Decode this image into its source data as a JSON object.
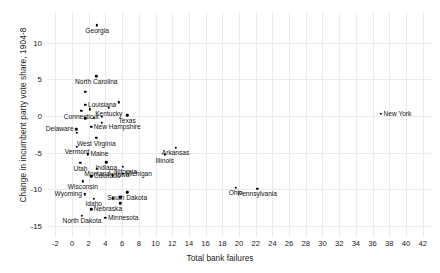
{
  "chart_data": {
    "type": "scatter",
    "title": "",
    "xlabel": "Total bank failures",
    "ylabel": "Change in incumbent party vote share, 1904-8",
    "xlim": [
      -3,
      43
    ],
    "ylim": [
      -16.5,
      14.2
    ],
    "xticks": [
      -2,
      0,
      2,
      4,
      6,
      8,
      10,
      12,
      14,
      16,
      18,
      20,
      22,
      24,
      26,
      28,
      30,
      32,
      34,
      36,
      38,
      40,
      42
    ],
    "yticks": [
      10,
      5,
      0,
      -5,
      -10,
      -15
    ],
    "grid": true,
    "legend": "none",
    "points": [
      {
        "label": "Georgia",
        "x": 3.0,
        "y": 12.4,
        "pos": "below"
      },
      {
        "label": "North Carolina",
        "x": 2.9,
        "y": 5.4,
        "pos": "below"
      },
      {
        "label": "",
        "x": 1.6,
        "y": 3.3,
        "pos": "below"
      },
      {
        "label": "Louisiana",
        "x": 1.6,
        "y": 1.5,
        "pos": "right"
      },
      {
        "label": "",
        "x": 5.6,
        "y": 1.9,
        "pos": "right"
      },
      {
        "label": "Kentucky",
        "x": 4.4,
        "y": 1.1,
        "pos": "below"
      },
      {
        "label": "Connecticut",
        "x": 1.1,
        "y": 0.7,
        "pos": "below"
      },
      {
        "label": "",
        "x": 2.1,
        "y": 0.9,
        "pos": "right"
      },
      {
        "label": "Texas",
        "x": 6.6,
        "y": 0.1,
        "pos": "below"
      },
      {
        "label": "",
        "x": 1.6,
        "y": -0.3,
        "pos": "right"
      },
      {
        "label": "",
        "x": 2.6,
        "y": -0.2,
        "pos": "right"
      },
      {
        "label": "",
        "x": 3.6,
        "y": -0.1,
        "pos": "right"
      },
      {
        "label": "",
        "x": 3.6,
        "y": -0.9,
        "pos": "right"
      },
      {
        "label": "New Hampshire",
        "x": 2.3,
        "y": -1.5,
        "pos": "right"
      },
      {
        "label": "Delaware",
        "x": 0.5,
        "y": -1.8,
        "pos": "left"
      },
      {
        "label": "",
        "x": 0.6,
        "y": -2.3,
        "pos": "right"
      },
      {
        "label": "West Virginia",
        "x": 2.9,
        "y": -3.0,
        "pos": "below"
      },
      {
        "label": "New York",
        "x": 37.0,
        "y": 0.3,
        "pos": "right"
      },
      {
        "label": "Vermont",
        "x": 0.6,
        "y": -4.2,
        "pos": "below"
      },
      {
        "label": "Arkansas",
        "x": 12.4,
        "y": -4.3,
        "pos": "below"
      },
      {
        "label": "Maine",
        "x": 1.9,
        "y": -5.2,
        "pos": "right"
      },
      {
        "label": "Illinois",
        "x": 11.1,
        "y": -5.3,
        "pos": "below"
      },
      {
        "label": "Utah",
        "x": 1.0,
        "y": -6.4,
        "pos": "below"
      },
      {
        "label": "Indiana",
        "x": 4.1,
        "y": -6.3,
        "pos": "below"
      },
      {
        "label": "California",
        "x": 6.1,
        "y": -6.9,
        "pos": "below"
      },
      {
        "label": "Montana",
        "x": 3.0,
        "y": -7.2,
        "pos": "below"
      },
      {
        "label": "Michigan",
        "x": 6.1,
        "y": -7.9,
        "pos": "right"
      },
      {
        "label": "Colorado",
        "x": 2.3,
        "y": -8.2,
        "pos": "right"
      },
      {
        "label": "Iowa",
        "x": 4.9,
        "y": -8.1,
        "pos": "right"
      },
      {
        "label": "Wisconsin",
        "x": 1.3,
        "y": -8.9,
        "pos": "below"
      },
      {
        "label": "Ohio",
        "x": 19.6,
        "y": -9.8,
        "pos": "below"
      },
      {
        "label": "Pennsylvania",
        "x": 22.2,
        "y": -9.9,
        "pos": "below"
      },
      {
        "label": "Wyoming",
        "x": 1.5,
        "y": -10.7,
        "pos": "left"
      },
      {
        "label": "South Dakota",
        "x": 6.6,
        "y": -10.4,
        "pos": "below"
      },
      {
        "label": "Idaho",
        "x": 2.6,
        "y": -11.3,
        "pos": "below"
      },
      {
        "label": "",
        "x": 4.9,
        "y": -11.2,
        "pos": "right"
      },
      {
        "label": "",
        "x": 5.8,
        "y": -11.1,
        "pos": "right"
      },
      {
        "label": "",
        "x": 5.8,
        "y": -11.9,
        "pos": "right"
      },
      {
        "label": "Nebraska",
        "x": 2.3,
        "y": -12.7,
        "pos": "right"
      },
      {
        "label": "North Dakota",
        "x": 1.2,
        "y": -13.6,
        "pos": "below"
      },
      {
        "label": "Minnesota",
        "x": 4.0,
        "y": -13.9,
        "pos": "right"
      }
    ]
  }
}
